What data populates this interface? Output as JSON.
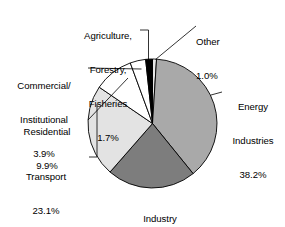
{
  "chart_data": {
    "type": "pie",
    "title": "",
    "subtitle": "",
    "xlabel": "",
    "ylabel": "",
    "legend_position": "none",
    "grid": false,
    "units": "%",
    "start_angle_deg": 0,
    "direction": "clockwise",
    "categories": [
      "Other",
      "Energy Industries",
      "Industry",
      "Transport",
      "Residential",
      "Commercial/Institutional",
      "Agriculture, Forestry, Fisheries"
    ],
    "values": [
      1.0,
      38.2,
      22.3,
      23.1,
      9.9,
      3.9,
      1.7
    ],
    "slices": [
      {
        "name": "Other",
        "label_lines": [
          "Other",
          "1.0%"
        ],
        "value": 1.0,
        "value_text": "1.0%",
        "color": "#e8e8e8",
        "stroke": "#000000"
      },
      {
        "name": "Energy Industries",
        "label_lines": [
          "Energy",
          "Industries",
          "38.2%"
        ],
        "value": 38.2,
        "value_text": "38.2%",
        "color": "#a9a9a9",
        "stroke": "#000000"
      },
      {
        "name": "Industry",
        "label_lines": [
          "Industry",
          "22.3%"
        ],
        "value": 22.3,
        "value_text": "22.3%",
        "color": "#7d7d7d",
        "stroke": "#000000"
      },
      {
        "name": "Transport",
        "label_lines": [
          "Transport",
          "23.1%"
        ],
        "value": 23.1,
        "value_text": "23.1%",
        "color": "#e3e3e3",
        "stroke": "#000000"
      },
      {
        "name": "Residential",
        "label_lines": [
          "Residential",
          "9.9%"
        ],
        "value": 9.9,
        "value_text": "9.9%",
        "color": "#ffffff",
        "stroke": "#000000"
      },
      {
        "name": "Commercial/Institutional",
        "label_lines": [
          "Commercial/",
          "Institutional",
          "3.9%"
        ],
        "value": 3.9,
        "value_text": "3.9%",
        "color": "#ffffff",
        "stroke": "#000000"
      },
      {
        "name": "Agriculture, Forestry, Fisheries",
        "label_lines": [
          "Agriculture,",
          "Forestry,",
          "Fisheries",
          "1.7%"
        ],
        "value": 1.7,
        "value_text": "1.7%",
        "color": "#000000",
        "stroke": "#000000"
      }
    ],
    "total": 100.1,
    "background_color": "#ffffff",
    "text_color": "#000000"
  },
  "labels": {
    "agriculture": {
      "l1": "Agriculture,",
      "l2": "Forestry,",
      "l3": "Fisheries",
      "l4": "1.7%"
    },
    "other": {
      "l1": "Other",
      "l2": "1.0%"
    },
    "commercial": {
      "l1": "Commercial/",
      "l2": "Institutional",
      "l3": "3.9%"
    },
    "residential": {
      "l1": "Residential",
      "l2": "9.9%"
    },
    "transport": {
      "l1": "Transport",
      "l2": "23.1%"
    },
    "energy": {
      "l1": "Energy",
      "l2": "Industries",
      "l3": "38.2%"
    },
    "industry": {
      "l1": "Industry",
      "l2": "22.3%"
    }
  }
}
